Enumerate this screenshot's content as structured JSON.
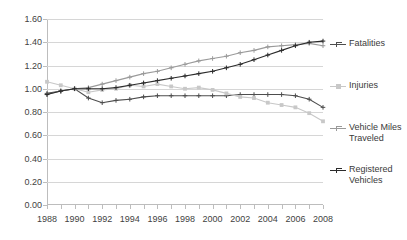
{
  "chart_data": {
    "type": "line",
    "title": "",
    "subtitle": "",
    "xlabel": "",
    "ylabel": "",
    "x": [
      1988,
      1989,
      1990,
      1991,
      1992,
      1993,
      1994,
      1995,
      1996,
      1997,
      1998,
      1999,
      2000,
      2001,
      2002,
      2003,
      2004,
      2005,
      2006,
      2007,
      2008
    ],
    "xlim": [
      1988,
      2008
    ],
    "ylim": [
      0.0,
      1.6
    ],
    "ytick_labels": [
      "0.00",
      "0.20",
      "0.40",
      "0.60",
      "0.80",
      "1.00",
      "1.20",
      "1.40",
      "1.60"
    ],
    "ytick_values": [
      0.0,
      0.2,
      0.4,
      0.6,
      0.8,
      1.0,
      1.2,
      1.4,
      1.6
    ],
    "xtick_labels": [
      "1988",
      "1990",
      "1992",
      "1994",
      "1996",
      "1998",
      "2000",
      "2002",
      "2004",
      "2006",
      "2008"
    ],
    "xtick_values": [
      1988,
      1990,
      1992,
      1994,
      1996,
      1998,
      2000,
      2002,
      2004,
      2006,
      2008
    ],
    "grid": true,
    "legend_position": "right",
    "series": [
      {
        "name": "Fatalities",
        "color": "#4d4d4d",
        "marker": "plus",
        "values": [
          0.96,
          0.98,
          1.0,
          0.92,
          0.88,
          0.9,
          0.91,
          0.93,
          0.94,
          0.94,
          0.94,
          0.94,
          0.94,
          0.94,
          0.95,
          0.95,
          0.95,
          0.95,
          0.94,
          0.91,
          0.84
        ]
      },
      {
        "name": "Injuries",
        "color": "#c8c8c8",
        "marker": "square",
        "values": [
          1.06,
          1.03,
          1.0,
          0.97,
          0.99,
          1.0,
          1.03,
          1.02,
          1.04,
          1.02,
          1.0,
          1.01,
          0.99,
          0.96,
          0.93,
          0.92,
          0.88,
          0.86,
          0.84,
          0.79,
          0.72
        ]
      },
      {
        "name": "Vehicle Miles Traveled",
        "color": "#9a9a9a",
        "marker": "plus",
        "values": [
          0.95,
          0.98,
          1.0,
          1.01,
          1.04,
          1.07,
          1.1,
          1.13,
          1.15,
          1.18,
          1.21,
          1.24,
          1.26,
          1.28,
          1.31,
          1.33,
          1.36,
          1.37,
          1.38,
          1.39,
          1.37
        ]
      },
      {
        "name": "Registered Vehicles",
        "color": "#2b2b2b",
        "marker": "plus",
        "values": [
          0.95,
          0.98,
          1.0,
          1.0,
          1.0,
          1.01,
          1.03,
          1.05,
          1.07,
          1.09,
          1.11,
          1.13,
          1.15,
          1.18,
          1.21,
          1.25,
          1.29,
          1.33,
          1.37,
          1.4,
          1.41
        ]
      }
    ]
  },
  "legend": {
    "items": [
      {
        "label": "Fatalities"
      },
      {
        "label": "Injuries"
      },
      {
        "label": "Vehicle Miles Traveled"
      },
      {
        "label": "Registered Vehicles"
      }
    ]
  }
}
